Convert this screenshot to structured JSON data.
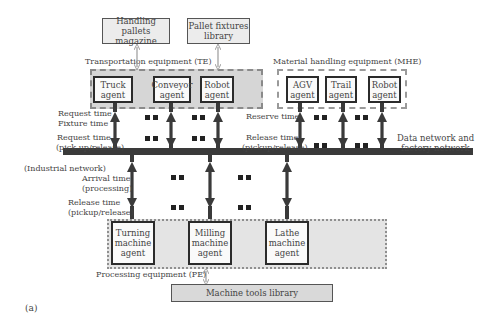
{
  "libraries": {
    "handling_pallets": "Handling pallets magazine",
    "pallet_fixtures": "Pallet fixtures library",
    "machine_tools": "Machine tools library"
  },
  "groups": {
    "te": {
      "label": "Transportation equipment (TE)",
      "agents": [
        "Truck agent",
        "Conveyor agent",
        "Robot agent"
      ]
    },
    "mhe": {
      "label": "Material handling equipment (MHE)",
      "agents": [
        "AGV agent",
        "Trail agent",
        "Robot agent"
      ]
    },
    "pe": {
      "label": "Processing equipment (PE)",
      "agents": [
        "Turning machine agent",
        "Milling machine agent",
        "Lathe machine agent"
      ]
    }
  },
  "te_labels": {
    "request_time": "Request time",
    "fixture_time": "Fixture time",
    "request_time2": "Request time",
    "pickup_release": "(pick up/release)"
  },
  "mhe_labels": {
    "reserve_time": "Reserve time",
    "release_time": "Release time",
    "pickup_release": "(pickup/release)"
  },
  "network": {
    "label_line1": "Data network and",
    "label_line2": "factory network",
    "industrial": "(Industrial network)"
  },
  "pe_labels": {
    "arrival_time": "Arrival time",
    "processing": "(processing)",
    "release_time": "Release time",
    "pickup_release": "(pickup/release)"
  },
  "figure_label": "(a)",
  "colors": {
    "bus": "#3a3a3a",
    "te_fill": "#d6d6d6",
    "pe_fill": "#e4e4e4",
    "lib_fill": "#ececec",
    "thin_arrow": "#9a9a9a"
  }
}
